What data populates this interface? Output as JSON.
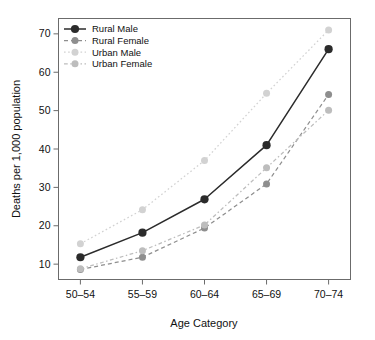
{
  "chart_data": {
    "type": "line",
    "title": "",
    "xlabel": "Age Category",
    "ylabel": "Deaths per 1,000 population",
    "categories": [
      "50–54",
      "55–59",
      "60–64",
      "65–69",
      "70–74"
    ],
    "ylim": [
      6,
      74
    ],
    "yticks": [
      10,
      20,
      30,
      40,
      50,
      60,
      70
    ],
    "ytick_labels": [
      "10",
      "20",
      "30",
      "40",
      "50",
      "60",
      "70"
    ],
    "grid": false,
    "legend_position": "top-left",
    "series": [
      {
        "name": "Rural Male",
        "values": [
          11.8,
          18.2,
          26.9,
          41.0,
          66.0
        ],
        "color": "#2b2b2b",
        "dash": "none",
        "marker": "filled-circle",
        "marker_size": 4.1
      },
      {
        "name": "Rural Female",
        "values": [
          8.6,
          11.8,
          19.4,
          30.9,
          54.2
        ],
        "color": "#8e8e8e",
        "dash": "dashed",
        "marker": "filled-circle",
        "marker_size": 3.5
      },
      {
        "name": "Urban Male",
        "values": [
          15.3,
          24.2,
          37.0,
          54.5,
          71.0
        ],
        "color": "#d2d2d2",
        "dash": "dotted",
        "marker": "filled-circle",
        "marker_size": 3.5
      },
      {
        "name": "Urban Female",
        "values": [
          8.8,
          13.5,
          20.2,
          35.1,
          50.1
        ],
        "color": "#bdbdbd",
        "dash": "dash-dot",
        "marker": "filled-circle",
        "marker_size": 3.5
      }
    ]
  },
  "axes": {
    "x_title": "Age Category",
    "y_title": "Deaths per 1,000 population"
  },
  "legend": {
    "entries": [
      "Rural Male",
      "Rural Female",
      "Urban Male",
      "Urban Female"
    ]
  },
  "colors": {
    "frame": "#6b6b6b",
    "background": "#ffffff",
    "text": "#111111"
  }
}
